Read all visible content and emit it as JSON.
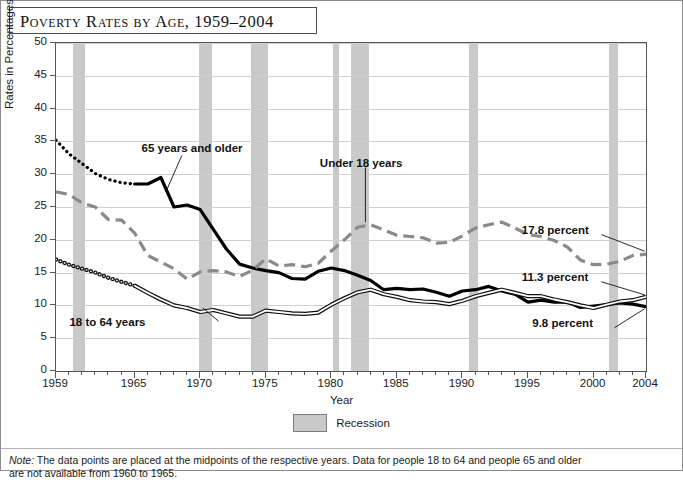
{
  "title": "Poverty Rates by Age, 1959–2004",
  "legend": {
    "label": "Recession",
    "swatch_color": "#c9c9c9"
  },
  "note": {
    "prefix": "Note:",
    "text": " The data points are placed at the midpoints of the respective years. Data for people 18 to 64 and people 65 and older",
    "line2": "are not available from 1960 to 1965."
  },
  "annotations": {
    "over65": "65 years and older",
    "under18": "Under 18 years",
    "adults": "18 to 64 years",
    "end_under18": "17.8 percent",
    "end_adults": "11.3 percent",
    "end_over65": "9.8 percent"
  },
  "chart_data": {
    "type": "line",
    "title": "Poverty Rates by Age, 1959–2004",
    "xlabel": "Year",
    "ylabel": "Rates in Percentages",
    "xlim": [
      1959,
      2004
    ],
    "ylim": [
      0,
      50
    ],
    "ytick_labels": [
      "0",
      "5",
      "10",
      "15",
      "20",
      "25",
      "30",
      "35",
      "40",
      "45",
      "50"
    ],
    "xtick_labels": [
      "1959",
      "1965",
      "1970",
      "1975",
      "1980",
      "1985",
      "1990",
      "1995",
      "2000",
      "2004"
    ],
    "grid": true,
    "legend_position": "below",
    "x": [
      1959,
      1960,
      1961,
      1962,
      1963,
      1964,
      1965,
      1966,
      1967,
      1968,
      1969,
      1970,
      1971,
      1972,
      1973,
      1974,
      1975,
      1976,
      1977,
      1978,
      1979,
      1980,
      1981,
      1982,
      1983,
      1984,
      1985,
      1986,
      1987,
      1988,
      1989,
      1990,
      1991,
      1992,
      1993,
      1994,
      1995,
      1996,
      1997,
      1998,
      1999,
      2000,
      2001,
      2002,
      2003,
      2004
    ],
    "series": [
      {
        "name": "65 years and older",
        "style": "thick-solid-with-dotted-gap",
        "color": "#000000",
        "dotted_range": [
          1959,
          1965
        ],
        "end_value": 9.8,
        "values": [
          35.2,
          33.1,
          31.6,
          30.1,
          29.2,
          28.7,
          28.5,
          28.5,
          29.5,
          25.0,
          25.3,
          24.6,
          21.6,
          18.6,
          16.3,
          15.7,
          15.3,
          15.0,
          14.1,
          14.0,
          15.2,
          15.7,
          15.3,
          14.6,
          13.8,
          12.4,
          12.6,
          12.4,
          12.5,
          12.0,
          11.4,
          12.2,
          12.4,
          12.9,
          12.2,
          11.7,
          10.5,
          10.8,
          10.5,
          10.5,
          9.7,
          9.9,
          10.1,
          10.4,
          10.2,
          9.8
        ]
      },
      {
        "name": "Under 18 years",
        "style": "dashed",
        "color": "#8a8a8a",
        "end_value": 17.8,
        "values": [
          27.3,
          26.9,
          25.6,
          25.0,
          23.1,
          23.0,
          21.0,
          17.6,
          16.6,
          15.6,
          14.0,
          15.1,
          15.3,
          15.1,
          14.4,
          15.4,
          17.1,
          16.0,
          16.2,
          15.9,
          16.4,
          18.3,
          20.0,
          21.9,
          22.3,
          21.5,
          20.7,
          20.5,
          20.3,
          19.5,
          19.6,
          20.6,
          21.8,
          22.3,
          22.7,
          21.8,
          20.8,
          20.5,
          19.9,
          18.9,
          16.9,
          16.2,
          16.3,
          16.7,
          17.6,
          17.8
        ]
      },
      {
        "name": "18 to 64 years",
        "style": "thin-double-with-dotted-gap",
        "color": "#111111",
        "dotted_range": [
          1959,
          1965
        ],
        "end_value": 11.3,
        "values": [
          17.0,
          16.2,
          15.6,
          15.0,
          14.2,
          13.6,
          13.0,
          11.9,
          10.9,
          10.0,
          9.6,
          9.0,
          9.3,
          8.8,
          8.3,
          8.3,
          9.2,
          9.0,
          8.8,
          8.7,
          8.9,
          10.1,
          11.1,
          12.0,
          12.4,
          11.7,
          11.3,
          10.8,
          10.6,
          10.5,
          10.2,
          10.7,
          11.4,
          11.9,
          12.4,
          11.9,
          11.4,
          11.4,
          10.9,
          10.5,
          10.0,
          9.6,
          10.1,
          10.6,
          10.8,
          11.3
        ]
      }
    ],
    "recessions": [
      [
        1960.3,
        1961.2
      ],
      [
        1969.9,
        1970.9
      ],
      [
        1973.9,
        1975.2
      ],
      [
        1980.1,
        1980.6
      ],
      [
        1981.5,
        1982.9
      ],
      [
        1990.5,
        1991.2
      ],
      [
        2001.2,
        2001.9
      ]
    ]
  }
}
